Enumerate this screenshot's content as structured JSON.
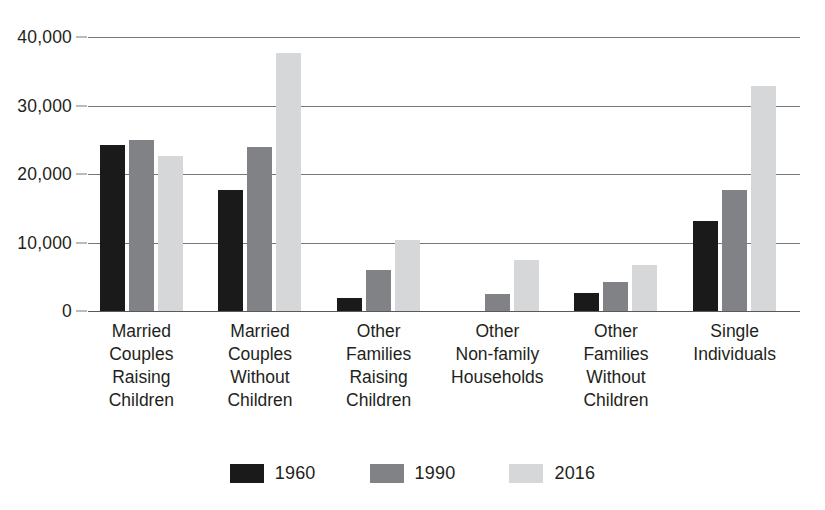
{
  "chart_data": {
    "type": "bar",
    "title": "",
    "subtitle": "",
    "xlabel": "",
    "ylabel": "",
    "ylim": [
      0,
      40000
    ],
    "grid": true,
    "legend_position": "bottom",
    "categories": [
      "Married Couples Raising Children",
      "Married Couples Without Children",
      "Other Families Raising Children",
      "Other Non-family Households",
      "Other Families Without Children",
      "Single Individuals"
    ],
    "category_lines": [
      [
        "Married",
        "Couples",
        "Raising",
        "Children"
      ],
      [
        "Married",
        "Couples",
        "Without",
        "Children"
      ],
      [
        "Other",
        "Families",
        "Raising",
        "Children"
      ],
      [
        "Other",
        "Non-family",
        "Households"
      ],
      [
        "Other",
        "Families",
        "Without",
        "Children"
      ],
      [
        "Single",
        "Individuals"
      ]
    ],
    "ytick_labels": [
      "40,000",
      "30,000",
      "20,000",
      "10,000",
      "0"
    ],
    "ytick_values": [
      40000,
      30000,
      20000,
      10000,
      0
    ],
    "series": [
      {
        "name": "1960",
        "color": "#1a1a1a",
        "values": [
          24200,
          17600,
          1900,
          0,
          2600,
          13100
        ]
      },
      {
        "name": "1990",
        "color": "#808285",
        "values": [
          25000,
          24000,
          6000,
          2500,
          4200,
          17700
        ]
      },
      {
        "name": "2016",
        "color": "#d5d7d8",
        "values": [
          22600,
          37600,
          10400,
          7400,
          6700,
          32800
        ]
      }
    ]
  },
  "legend": {
    "items": [
      {
        "label": "1960",
        "color": "#1a1a1a"
      },
      {
        "label": "1990",
        "color": "#808285"
      },
      {
        "label": "2016",
        "color": "#d5d7d8"
      }
    ]
  }
}
